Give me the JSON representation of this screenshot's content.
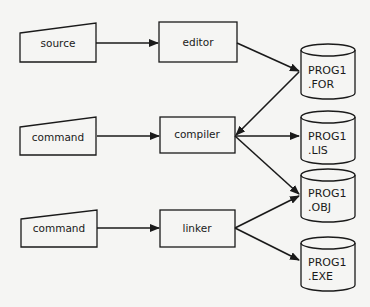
{
  "diagram": {
    "inputs": [
      {
        "id": "source",
        "label": "source",
        "shape": "manual-input"
      },
      {
        "id": "command1",
        "label": "command",
        "shape": "manual-input"
      },
      {
        "id": "command2",
        "label": "command",
        "shape": "manual-input"
      }
    ],
    "processes": [
      {
        "id": "editor",
        "label": "editor"
      },
      {
        "id": "compiler",
        "label": "compiler"
      },
      {
        "id": "linker",
        "label": "linker"
      }
    ],
    "files": [
      {
        "id": "for",
        "line1": "PROG1",
        "line2": ".FOR"
      },
      {
        "id": "lis",
        "line1": "PROG1",
        "line2": ".LIS"
      },
      {
        "id": "obj",
        "line1": "PROG1",
        "line2": ".OBJ"
      },
      {
        "id": "exe",
        "line1": "PROG1",
        "line2": ".EXE"
      }
    ],
    "edges": [
      {
        "from": "source",
        "to": "editor"
      },
      {
        "from": "command1",
        "to": "compiler"
      },
      {
        "from": "command2",
        "to": "linker"
      },
      {
        "from": "editor",
        "to": "for"
      },
      {
        "from": "for",
        "to": "compiler"
      },
      {
        "from": "compiler",
        "to": "lis"
      },
      {
        "from": "compiler",
        "to": "obj"
      },
      {
        "from": "obj",
        "to": "linker"
      },
      {
        "from": "linker",
        "to": "exe"
      }
    ],
    "colors": {
      "stroke": "#1a1a1a",
      "fill": "#f5f5f3"
    }
  }
}
